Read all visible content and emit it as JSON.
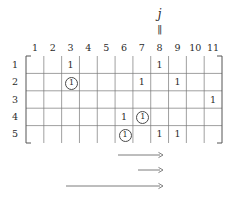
{
  "figure": {
    "pointer": {
      "label": "j",
      "bar_glyph": "‖",
      "target_column": 8
    },
    "matrix": {
      "rows": 5,
      "cols": 11,
      "column_headers": [
        "1",
        "2",
        "3",
        "4",
        "5",
        "6",
        "7",
        "8",
        "9",
        "10",
        "11"
      ],
      "row_labels": [
        "1",
        "2",
        "3",
        "4",
        "5"
      ],
      "entries": [
        {
          "row": 1,
          "col": 3,
          "value": "1",
          "circled": false
        },
        {
          "row": 1,
          "col": 8,
          "value": "1",
          "circled": false
        },
        {
          "row": 2,
          "col": 3,
          "value": "1",
          "circled": true
        },
        {
          "row": 2,
          "col": 7,
          "value": "1",
          "circled": false
        },
        {
          "row": 2,
          "col": 9,
          "value": "1",
          "circled": false
        },
        {
          "row": 3,
          "col": 11,
          "value": "1",
          "circled": false
        },
        {
          "row": 4,
          "col": 6,
          "value": "1",
          "circled": false
        },
        {
          "row": 4,
          "col": 7,
          "value": "1",
          "circled": true
        },
        {
          "row": 5,
          "col": 6,
          "value": "1",
          "circled": true
        },
        {
          "row": 5,
          "col": 8,
          "value": "1",
          "circled": false
        },
        {
          "row": 5,
          "col": 9,
          "value": "1",
          "circled": false
        }
      ]
    },
    "arrows": [
      {
        "index": 1,
        "x_start": 118,
        "x_end": 163,
        "y": 155
      },
      {
        "index": 2,
        "x_start": 138,
        "x_end": 163,
        "y": 170
      },
      {
        "index": 3,
        "x_start": 66,
        "x_end": 163,
        "y": 186
      }
    ],
    "colors": {
      "ink": "#2b2b2b",
      "grid": "#777777",
      "bracket": "#555555",
      "arrow": "#6e6e6e",
      "background": "#ffffff"
    }
  }
}
